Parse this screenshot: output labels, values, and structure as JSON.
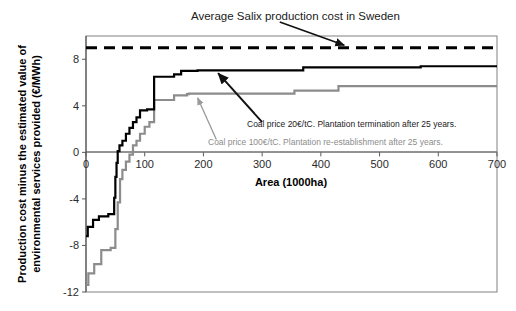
{
  "chart_data": {
    "type": "line",
    "title": "Average Salix production cost in Sweden",
    "xlabel": "Area (1000ha)",
    "ylabel": "Production cost minus the estimated value of environmental services provided (€/MWh)",
    "xlim": [
      0,
      700
    ],
    "ylim": [
      -12,
      10
    ],
    "xticks": [
      "0",
      "100",
      "200",
      "300",
      "400",
      "500",
      "600",
      "700"
    ],
    "xtick_values": [
      0,
      100,
      200,
      300,
      400,
      500,
      600,
      700
    ],
    "yticks": [
      "8",
      "4",
      "0",
      "-4",
      "-8",
      "-12"
    ],
    "ytick_values": [
      8,
      4,
      0,
      -4,
      -8,
      -12
    ],
    "grid": false,
    "legend_position": "annotations-inside-plot",
    "series": [
      {
        "name": "Coal price 20€/tC. Plantation termination after 25 years.",
        "color": "#000000",
        "style": "step",
        "width": 2.2,
        "points": [
          [
            0,
            -7.2
          ],
          [
            3,
            -7.2
          ],
          [
            3,
            -6.4
          ],
          [
            12,
            -6.4
          ],
          [
            12,
            -5.8
          ],
          [
            22,
            -5.8
          ],
          [
            22,
            -5.5
          ],
          [
            38,
            -5.5
          ],
          [
            38,
            -5.3
          ],
          [
            48,
            -5.3
          ],
          [
            48,
            -3.9
          ],
          [
            50,
            -3.9
          ],
          [
            50,
            -2.1
          ],
          [
            52,
            -2.1
          ],
          [
            52,
            -0.9
          ],
          [
            54,
            -0.9
          ],
          [
            54,
            0.1
          ],
          [
            57,
            0.1
          ],
          [
            57,
            0.6
          ],
          [
            62,
            0.6
          ],
          [
            62,
            1.0
          ],
          [
            68,
            1.0
          ],
          [
            68,
            1.6
          ],
          [
            74,
            1.6
          ],
          [
            74,
            2.1
          ],
          [
            80,
            2.1
          ],
          [
            80,
            2.6
          ],
          [
            86,
            2.6
          ],
          [
            86,
            3.0
          ],
          [
            92,
            3.0
          ],
          [
            92,
            3.6
          ],
          [
            104,
            3.6
          ],
          [
            104,
            3.7
          ],
          [
            116,
            3.7
          ],
          [
            116,
            6.5
          ],
          [
            150,
            6.5
          ],
          [
            150,
            6.7
          ],
          [
            162,
            6.7
          ],
          [
            162,
            7.0
          ],
          [
            190,
            7.0
          ],
          [
            190,
            7.05
          ],
          [
            370,
            7.05
          ],
          [
            370,
            7.3
          ],
          [
            570,
            7.3
          ],
          [
            570,
            7.4
          ],
          [
            700,
            7.4
          ]
        ]
      },
      {
        "name": "Coal price 100€/tC. Plantation re-establishment after 25 years.",
        "color": "#8c8c8c",
        "style": "step",
        "width": 2.2,
        "points": [
          [
            0,
            -11.4
          ],
          [
            4,
            -11.4
          ],
          [
            4,
            -10.4
          ],
          [
            14,
            -10.4
          ],
          [
            14,
            -9.6
          ],
          [
            26,
            -9.6
          ],
          [
            26,
            -8.4
          ],
          [
            42,
            -8.4
          ],
          [
            42,
            -8.2
          ],
          [
            50,
            -8.2
          ],
          [
            50,
            -6.6
          ],
          [
            54,
            -6.6
          ],
          [
            54,
            -4.3
          ],
          [
            58,
            -4.3
          ],
          [
            58,
            -2.3
          ],
          [
            62,
            -2.3
          ],
          [
            62,
            -1.5
          ],
          [
            68,
            -1.5
          ],
          [
            68,
            -0.8
          ],
          [
            74,
            -0.8
          ],
          [
            74,
            -0.2
          ],
          [
            80,
            -0.2
          ],
          [
            80,
            0.6
          ],
          [
            86,
            0.6
          ],
          [
            86,
            1.0
          ],
          [
            92,
            1.0
          ],
          [
            92,
            1.6
          ],
          [
            100,
            1.6
          ],
          [
            100,
            2.2
          ],
          [
            108,
            2.2
          ],
          [
            108,
            2.6
          ],
          [
            116,
            2.6
          ],
          [
            116,
            4.5
          ],
          [
            150,
            4.5
          ],
          [
            150,
            4.9
          ],
          [
            172,
            4.9
          ],
          [
            172,
            5.0
          ],
          [
            175,
            5.0
          ],
          [
            175,
            5.05
          ],
          [
            355,
            5.05
          ],
          [
            355,
            5.3
          ],
          [
            430,
            5.3
          ],
          [
            430,
            5.7
          ],
          [
            700,
            5.7
          ]
        ]
      },
      {
        "name": "Average Salix production cost in Sweden",
        "color": "#000000",
        "style": "dashed",
        "width": 3.0,
        "constant_y": 9.0,
        "points": [
          [
            0,
            9.0
          ],
          [
            700,
            9.0
          ]
        ]
      }
    ],
    "annotations": [
      {
        "id": "title-callout",
        "text": "Average Salix production cost in Sweden",
        "color": "#1a1a1a",
        "arrow_from": [
          330,
          11.2
        ],
        "arrow_to": [
          440,
          9.2
        ]
      },
      {
        "id": "black-series-callout",
        "text": "Coal price 20€/tC. Plantation termination after 25 years.",
        "color": "#1a1a1a",
        "arrow_from": [
          300,
          2.6
        ],
        "arrow_to": [
          225,
          6.8
        ]
      },
      {
        "id": "gray-series-callout",
        "text": "Coal price 100€/tC. Plantation re-establishment after 25 years.",
        "color": "#8c8c8c",
        "arrow_from": [
          222,
          1.1
        ],
        "arrow_to": [
          190,
          4.7
        ]
      }
    ]
  },
  "labels": {
    "title": "Average Salix production cost in Sweden",
    "xlabel": "Area (1000ha)",
    "ylabel_line1": "Production cost minus the estimated value of",
    "ylabel_line2": "environmental services provided (€/MWh)",
    "annot_black": "Coal price 20€/tC. Plantation termination after 25 years.",
    "annot_gray": "Coal price 100€/tC. Plantation re-establishment after 25 years.",
    "ytick_8": "8",
    "ytick_4": "4",
    "ytick_0": "0",
    "ytick_m4": "-4",
    "ytick_m8": "-8",
    "ytick_m12": "-12",
    "xtick_0": "0",
    "xtick_100": "100",
    "xtick_200": "200",
    "xtick_300": "300",
    "xtick_400": "400",
    "xtick_500": "500",
    "xtick_600": "600",
    "xtick_700": "700"
  },
  "colors": {
    "series_black": "#000000",
    "series_gray": "#8c8c8c",
    "axis": "#595959",
    "border": "#808080",
    "background": "#ffffff"
  }
}
